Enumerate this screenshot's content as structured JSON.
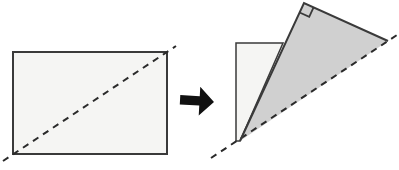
{
  "diagram": {
    "colors": {
      "background": "#ffffff",
      "paper_light": "#f5f5f3",
      "paper_shaded": "#d0d0d0",
      "outline": "#3a3a3a",
      "dash_line": "#2a2a2a",
      "arrow_fill": "#111111"
    },
    "dash_pattern": "6.5 5.5",
    "unfolded_rectangle": {
      "x": 13,
      "y": 52,
      "width": 154,
      "height": 102,
      "fold_line": {
        "x1": 3,
        "y1": 161,
        "x2": 176,
        "y2": 46
      }
    },
    "arrow": {
      "points": "180,96 199.5,96 199.5,86.5 214,101 199.5,115.5 199.5,105.5 180,105.5",
      "rotation": "rotate(3 197 101)"
    },
    "folded_figure": {
      "back_panel_points": "236,43 283,43 240,141 236,141",
      "triangle_points": "304,3 388,41 240,141",
      "triangle_solid_edges_points": "240,141 304,3 388,41",
      "right_angle_mark_points": "299.6,12.5 309.2,16.9 313.6,7.3",
      "fold_line": {
        "x1": 211,
        "y1": 158,
        "x2": 397,
        "y2": 35
      }
    }
  }
}
